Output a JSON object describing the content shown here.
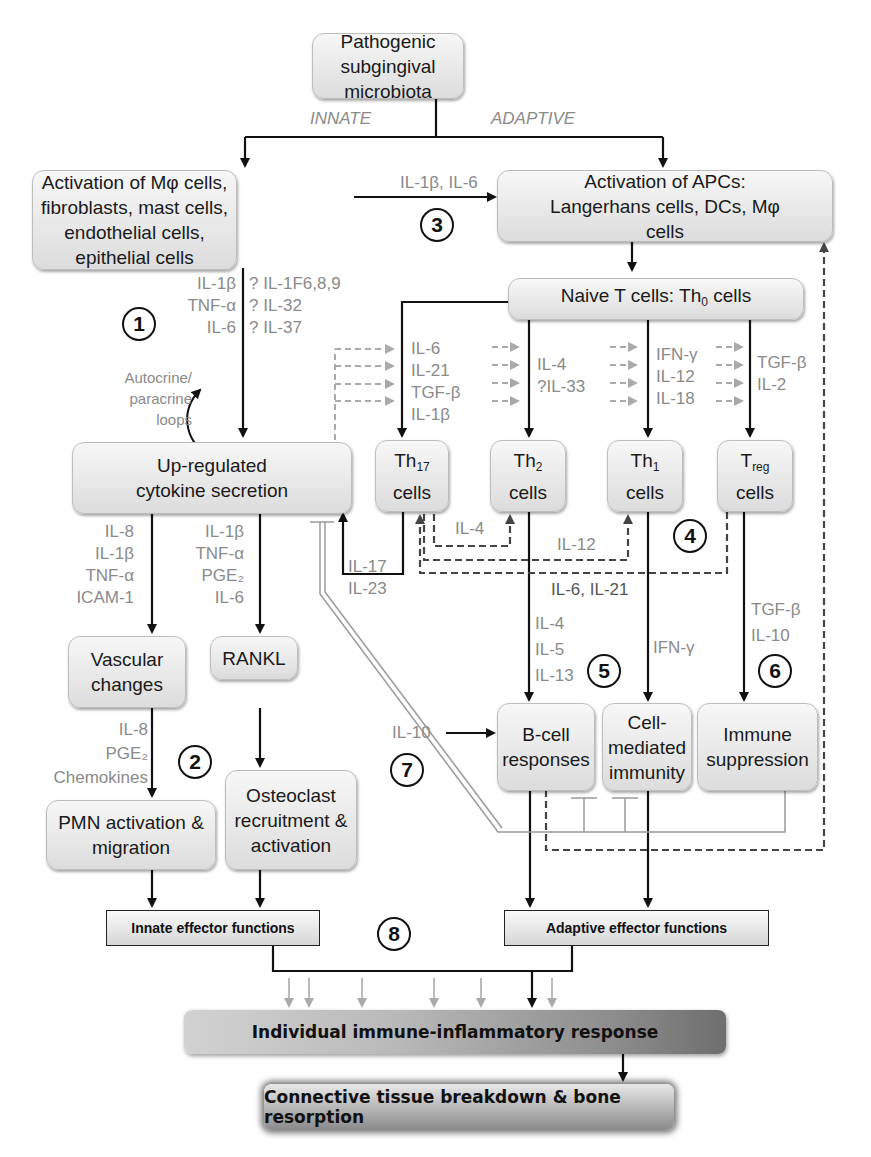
{
  "nodes": {
    "pathogen": "Pathogenic subgingival microbiota",
    "innate_activation": "Activation of Mφ cells, fibroblasts, mast cells, endothelial cells, epithelial cells",
    "apc_activation": "Activation of APCs: Langerhans cells, DCs, Mφ cells",
    "naive_t": "Naive T cells: Th",
    "naive_t_sub": "0",
    "naive_t_tail": " cells",
    "upregulated": "Up-regulated cytokine secretion",
    "th17": "Th",
    "th17_sub": "17",
    "th2": "Th",
    "th2_sub": "2",
    "th1": "Th",
    "th1_sub": "1",
    "treg": "T",
    "treg_sub": "reg",
    "cells": "cells",
    "vascular": "Vascular changes",
    "rankl": "RANKL",
    "pmn": "PMN activation & migration",
    "osteoclast": "Osteoclast recruitment & activation",
    "bcell": "B-cell responses",
    "cellmediated": "Cell-mediated immunity",
    "immunesupp": "Immune suppression",
    "innate_effector": "Innate effector functions",
    "adaptive_effector": "Adaptive effector functions",
    "individual_response": "Individual immune-inflammatory response",
    "connective": "Connective tissue breakdown & bone resorption"
  },
  "labels": {
    "innate": "INNATE",
    "adaptive": "ADAPTIVE",
    "il1b_il6": "IL-1β, IL-6",
    "step1_left": "IL-1β\nTNF-α\nIL-6",
    "step1_right": "? IL-1F6,8,9\n? IL-32\n? IL-37",
    "autocrine": "Autocrine/\nparacrine\nloops",
    "th17_inputs": "IL-6\nIL-21\nTGF-β\nIL-1β",
    "th2_inputs": "IL-4\n?IL-33",
    "th1_inputs": "IFN-γ\nIL-12\nIL-18",
    "treg_inputs": "TGF-β\nIL-2",
    "vascular_inputs": "IL-8\nIL-1β\nTNF-α\nICAM-1",
    "rankl_inputs": "IL-1β\nTNF-α\nPGE₂\nIL-6",
    "il17_il23": "IL-17\nIL-23",
    "il4_loop": "IL-4",
    "il12_loop": "IL-12",
    "il6_il21": "IL-6, IL-21",
    "bcell_inputs": "IL-4\nIL-5\nIL-13",
    "ifng": "IFN-γ",
    "treg_outputs": "TGF-β\nIL-10",
    "pmn_inputs": "IL-8\nPGE₂\nChemokines",
    "il10": "IL-10"
  },
  "step_numbers": [
    "1",
    "2",
    "3",
    "4",
    "5",
    "6",
    "7",
    "8"
  ],
  "colors": {
    "label_gray": "#8a8a8a",
    "arrow_black": "#111111",
    "dashed_dark": "#444444",
    "dashed_light": "#a8a8a8"
  }
}
